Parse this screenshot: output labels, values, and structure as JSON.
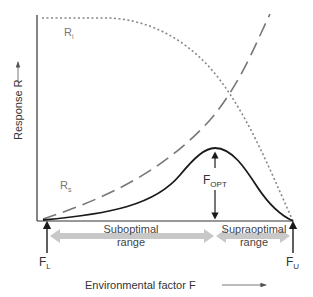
{
  "diagram": {
    "y_axis_label": "Response R",
    "x_axis_label": "Environmental factor F",
    "curves": {
      "ri": {
        "label": "R",
        "subscript": "i",
        "style": "dotted",
        "color": "#777777"
      },
      "rs": {
        "label": "R",
        "subscript": "s",
        "style": "dashed",
        "color": "#777777"
      },
      "response": {
        "style": "solid",
        "color": "#1a1a1a"
      }
    },
    "markers": {
      "f_lower": {
        "label": "F",
        "subscript": "L"
      },
      "f_upper": {
        "label": "F",
        "subscript": "U"
      },
      "f_opt": {
        "label": "F",
        "subscript": "OPT"
      }
    },
    "ranges": {
      "suboptimal": {
        "line1": "Suboptimal",
        "line2": "range"
      },
      "supraoptimal": {
        "line1": "Supraoptimal",
        "line2": "range"
      }
    },
    "range_arrow_color": "#c8c8c8"
  }
}
